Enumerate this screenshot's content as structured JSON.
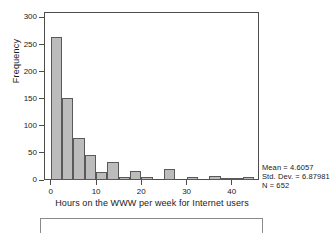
{
  "chart_data": {
    "type": "bar",
    "title": "",
    "subtitle": "",
    "xlabel": "Hours on the WWW per week for Internet users",
    "ylabel": "Frequency",
    "xlim": [
      -1.5,
      46
    ],
    "ylim": [
      0,
      310
    ],
    "xticks": [
      "0",
      "10",
      "20",
      "30",
      "40"
    ],
    "xtick_values": [
      0,
      10,
      20,
      30,
      40
    ],
    "yticks": [
      "0",
      "50",
      "100",
      "150",
      "200",
      "250",
      "300"
    ],
    "ytick_values": [
      0,
      50,
      100,
      150,
      200,
      250,
      300
    ],
    "grid": false,
    "legend": "none",
    "bin_width": 2.5,
    "bar_color": "#bcbcbc",
    "bar_edge_color": "#595959",
    "bin_centers": [
      1.25,
      3.75,
      6.25,
      8.75,
      11.25,
      13.75,
      16.25,
      18.75,
      21.25,
      23.75,
      26.25,
      28.75,
      31.25,
      33.75,
      36.25,
      38.75,
      41.25,
      43.75
    ],
    "bin_starts": [
      0,
      2.5,
      5,
      7.5,
      10,
      12.5,
      15,
      17.5,
      20,
      22.5,
      25,
      27.5,
      30,
      32.5,
      35,
      37.5,
      40,
      42.5
    ],
    "values": [
      264,
      152,
      78,
      47,
      14,
      34,
      5,
      16,
      5,
      0,
      20,
      0,
      6,
      0,
      7,
      1,
      1,
      6
    ],
    "annotations": [
      "Mean = 4.6057",
      "Std. Dev. = 6.87981",
      "N = 652"
    ]
  },
  "stats": {
    "mean_label": "Mean = 4.6057",
    "stddev_label": "Std. Dev. = 6.87981",
    "n_label": "N = 652"
  },
  "axes": {
    "x_title": "Hours on the WWW per week for Internet users",
    "y_title": "Frequency"
  }
}
